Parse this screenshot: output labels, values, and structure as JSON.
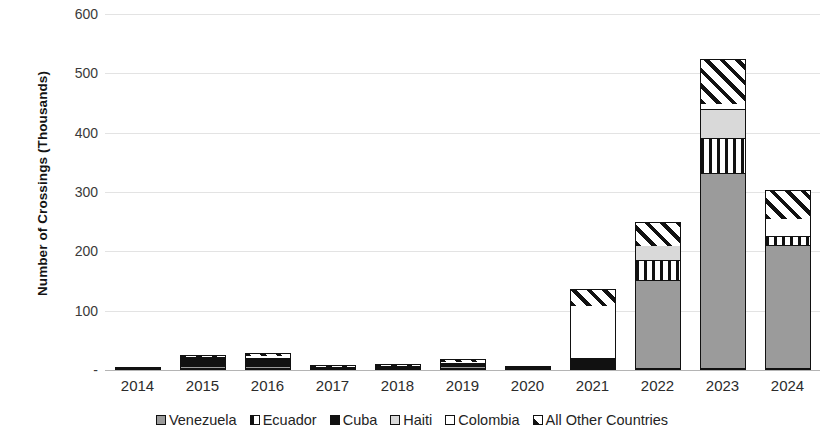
{
  "chart_data": {
    "type": "bar",
    "subtype": "stacked-bar",
    "title": "",
    "xlabel": "",
    "ylabel": "Number of Crossings (Thousands)",
    "ylim": [
      0,
      600
    ],
    "yticks": [
      "-",
      "100",
      "200",
      "300",
      "400",
      "500",
      "600"
    ],
    "ytick_values": [
      0,
      100,
      200,
      300,
      400,
      500,
      600
    ],
    "grid": true,
    "legend_position": "bottom",
    "categories": [
      "2014",
      "2015",
      "2016",
      "2017",
      "2018",
      "2019",
      "2020",
      "2021",
      "2022",
      "2023",
      "2024"
    ],
    "series": [
      {
        "name": "Venezuela",
        "pattern": "solid-gray",
        "color": "#9b9b9b",
        "values": [
          1,
          1,
          1,
          1,
          1,
          1,
          1,
          0,
          150,
          330,
          210
        ]
      },
      {
        "name": "Ecuador",
        "pattern": "vertical-stripes",
        "color": "#ffffff",
        "values": [
          0,
          0,
          0,
          0,
          0,
          0,
          0,
          0,
          35,
          60,
          15
        ]
      },
      {
        "name": "Cuba",
        "pattern": "solid-black",
        "color": "#111111",
        "values": [
          3,
          23,
          20,
          5,
          7,
          9,
          4,
          18,
          0,
          0,
          0
        ]
      },
      {
        "name": "Haiti",
        "pattern": "solid-light-gray",
        "color": "#d9d9d9",
        "values": [
          0,
          0,
          0,
          0,
          0,
          0,
          0,
          0,
          25,
          50,
          0
        ]
      },
      {
        "name": "Colombia",
        "pattern": "solid-white",
        "color": "#ffffff",
        "values": [
          0,
          0,
          6,
          0,
          0,
          4,
          0,
          90,
          0,
          10,
          30
        ]
      },
      {
        "name": "All Other Countries",
        "pattern": "diagonal-stripes",
        "color": "#ffffff",
        "values": [
          1,
          2,
          1,
          2,
          2,
          5,
          1,
          29,
          40,
          75,
          48
        ]
      }
    ],
    "totals": [
      5,
      26,
      28,
      8,
      10,
      19,
      6,
      137,
      250,
      525,
      303
    ]
  },
  "axes": {
    "y_title": "Number of Crossings (Thousands)"
  },
  "legend": {
    "items": [
      {
        "label": "Venezuela"
      },
      {
        "label": "Ecuador"
      },
      {
        "label": "Cuba"
      },
      {
        "label": "Haiti"
      },
      {
        "label": "Colombia"
      },
      {
        "label": "All Other Countries"
      }
    ]
  }
}
